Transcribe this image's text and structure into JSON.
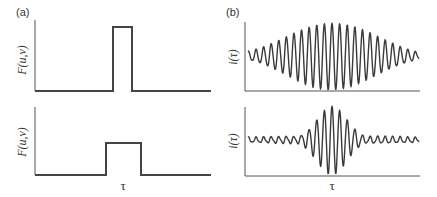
{
  "figure": {
    "panel_a": {
      "label": "(a)",
      "ylabel": "F(u,v)",
      "xlabel": "τ",
      "top_plot": {
        "description": "narrow rectangular spectrum",
        "pulse_left": 113,
        "pulse_right": 132,
        "pulse_top": 27
      },
      "bottom_plot": {
        "description": "wide rectangular spectrum",
        "pulse_left": 106,
        "pulse_right": 141,
        "pulse_top": 143
      }
    },
    "panel_b": {
      "label": "(b)",
      "ylabel": "i(τ)",
      "xlabel": "τ",
      "top_plot": {
        "description": "broad interferogram envelope"
      },
      "bottom_plot": {
        "description": "narrow interferogram envelope with side lobes"
      }
    }
  },
  "chart_data": [
    {
      "type": "line",
      "title": "(a) top",
      "xlabel": "",
      "ylabel": "F(u,v)",
      "shape": "rectangular pulse",
      "relative_width": 0.19,
      "relative_height": 0.92
    },
    {
      "type": "line",
      "title": "(a) bottom",
      "xlabel": "τ",
      "ylabel": "F(u,v)",
      "shape": "rectangular pulse",
      "relative_width": 0.35,
      "relative_height": 0.47
    },
    {
      "type": "line",
      "title": "(b) top",
      "xlabel": "",
      "ylabel": "i(τ)",
      "shape": "oscillation with wide gaussian envelope",
      "oscillations": 22
    },
    {
      "type": "line",
      "title": "(b) bottom",
      "xlabel": "τ",
      "ylabel": "i(τ)",
      "shape": "oscillation with narrow sinc-like envelope and side lobes",
      "oscillations": 22
    }
  ]
}
